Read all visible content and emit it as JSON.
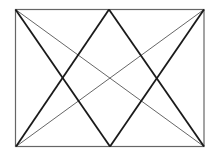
{
  "diagram": {
    "type": "geometric-figure",
    "colors": {
      "background": "#ffffff",
      "rectangle": "#555555",
      "diagonals": "#555555",
      "triangles": "#1a1a1a"
    },
    "points": {
      "top_left": [
        15,
        9
      ],
      "top_mid": [
        109,
        9
      ],
      "top_right": [
        204,
        9
      ],
      "bottom_left": [
        16,
        146
      ],
      "bottom_mid": [
        110,
        146
      ],
      "bottom_right": [
        204,
        146
      ]
    }
  }
}
